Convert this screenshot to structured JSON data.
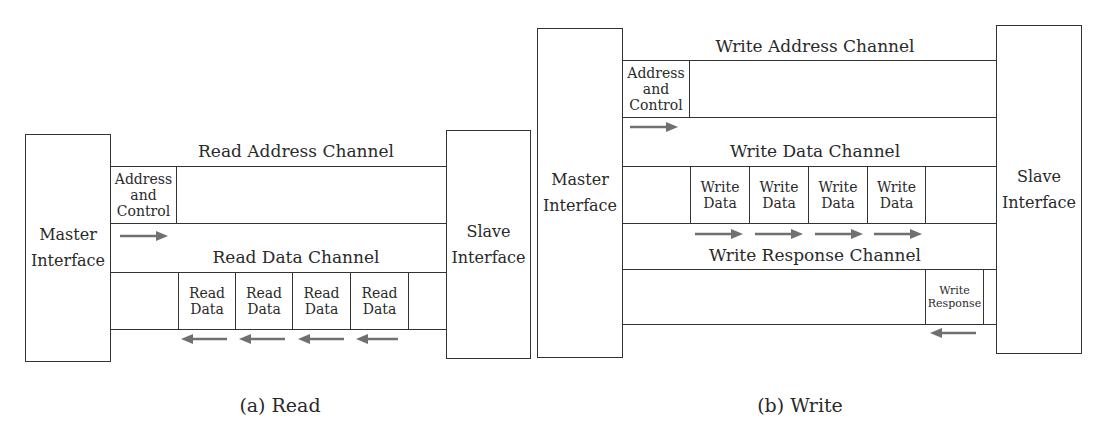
{
  "colors": {
    "line": "#333333",
    "arrow": "#707070",
    "text": "#2a2a2a",
    "background": "#ffffff"
  },
  "read_diagram": {
    "caption": "(a) Read",
    "master": {
      "line1": "Master",
      "line2": "Interface"
    },
    "slave": {
      "line1": "Slave",
      "line2": "Interface"
    },
    "address_channel": {
      "title": "Read Address Channel",
      "cell": {
        "line1": "Address",
        "line2": "and",
        "line3": "Control"
      },
      "arrow_direction": "right"
    },
    "data_channel": {
      "title": "Read Data Channel",
      "cells": [
        {
          "line1": "Read",
          "line2": "Data"
        },
        {
          "line1": "Read",
          "line2": "Data"
        },
        {
          "line1": "Read",
          "line2": "Data"
        },
        {
          "line1": "Read",
          "line2": "Data"
        }
      ],
      "arrow_direction": "left"
    }
  },
  "write_diagram": {
    "caption": "(b) Write",
    "master": {
      "line1": "Master",
      "line2": "Interface"
    },
    "slave": {
      "line1": "Slave",
      "line2": "Interface"
    },
    "address_channel": {
      "title": "Write Address Channel",
      "cell": {
        "line1": "Address",
        "line2": "and",
        "line3": "Control"
      },
      "arrow_direction": "right"
    },
    "data_channel": {
      "title": "Write Data Channel",
      "cells": [
        {
          "line1": "Write",
          "line2": "Data"
        },
        {
          "line1": "Write",
          "line2": "Data"
        },
        {
          "line1": "Write",
          "line2": "Data"
        },
        {
          "line1": "Write",
          "line2": "Data"
        }
      ],
      "arrow_direction": "right"
    },
    "response_channel": {
      "title": "Write Response Channel",
      "cell": {
        "line1": "Write",
        "line2": "Response"
      },
      "arrow_direction": "left"
    }
  }
}
